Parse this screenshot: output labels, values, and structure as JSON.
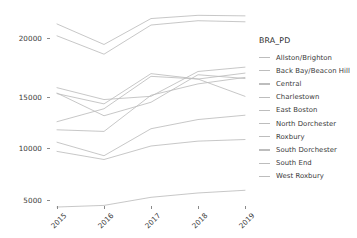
{
  "chart_data": {
    "type": "line",
    "title": "",
    "xlabel": "",
    "ylabel": "",
    "legend_title": "BRA_PD",
    "legend_position": "right",
    "grid": false,
    "x": [
      "2015",
      "2016",
      "2017",
      "2018",
      "2019"
    ],
    "xlim": [
      "2015",
      "2019"
    ],
    "ylim": [
      4000,
      22500
    ],
    "yticks": [
      5000,
      10000,
      15000,
      20000
    ],
    "ytick_labels": [
      "5000",
      "10000",
      "15000",
      "20000"
    ],
    "line_color": "#bdbdbd",
    "series": [
      {
        "name": "Allston/Brighton",
        "values": [
          21300,
          19400,
          21800,
          22100,
          22050
        ]
      },
      {
        "name": "Back Bay/Beacon Hill",
        "values": [
          20200,
          18500,
          21200,
          21600,
          21500
        ]
      },
      {
        "name": "Central",
        "values": [
          15400,
          14300,
          14600,
          16900,
          17300
        ]
      },
      {
        "name": "Charlestown",
        "values": [
          14900,
          12800,
          14050,
          16600,
          16250
        ]
      },
      {
        "name": "East Boston",
        "values": [
          14850,
          13900,
          16700,
          16200,
          14600
        ]
      },
      {
        "name": "North Dorchester",
        "values": [
          12250,
          13450,
          16450,
          16200,
          16750
        ]
      },
      {
        "name": "Roxbury",
        "values": [
          11500,
          11350,
          14700,
          15750,
          16350
        ]
      },
      {
        "name": "South Dorchester",
        "values": [
          10350,
          9100,
          11600,
          12450,
          12850
        ]
      },
      {
        "name": "South End",
        "values": [
          9500,
          8750,
          10000,
          10450,
          10600
        ]
      },
      {
        "name": "West Roxbury",
        "values": [
          4350,
          4500,
          5250,
          5650,
          5900
        ]
      }
    ]
  },
  "axes": {
    "ytick_labels": [
      "20000",
      "15000",
      "10000",
      "5000"
    ],
    "xtick_labels": [
      "2015",
      "2016",
      "2017",
      "2018",
      "2019"
    ]
  },
  "legend": {
    "title": "BRA_PD",
    "items": [
      {
        "label": "Allston/Brighton"
      },
      {
        "label": "Back Bay/Beacon Hill"
      },
      {
        "label": "Central"
      },
      {
        "label": "Charlestown"
      },
      {
        "label": "East Boston"
      },
      {
        "label": "North Dorchester"
      },
      {
        "label": "Roxbury"
      },
      {
        "label": "South Dorchester"
      },
      {
        "label": "South End"
      },
      {
        "label": "West Roxbury"
      }
    ]
  }
}
